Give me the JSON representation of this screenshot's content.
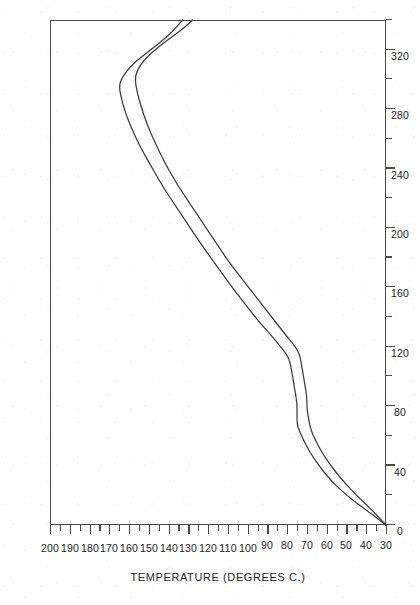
{
  "figure": {
    "style": "scanned-patent-line-drawing",
    "orientation": "rotated-90-ccw",
    "ink_color": "#3c3c3c",
    "paper_color": "#fefefe"
  },
  "chart_data": {
    "type": "line",
    "title": "",
    "xlabel": "CURE TIME (SECONDS)",
    "ylabel": "TEMPERATURE (DEGREES C.)",
    "xlim": [
      0,
      340
    ],
    "ylim": [
      30,
      200
    ],
    "grid": false,
    "legend": "none",
    "x_major_ticks": [
      0,
      40,
      80,
      120,
      160,
      200,
      240,
      280,
      320
    ],
    "x_minor_step": 20,
    "x_tick_labels": [
      "0",
      "40",
      "80",
      "120",
      "160",
      "200",
      "240",
      "280",
      "320"
    ],
    "y_major_ticks": [
      30,
      40,
      50,
      60,
      70,
      80,
      90,
      100,
      110,
      120,
      130,
      140,
      150,
      160,
      170,
      180,
      190,
      200
    ],
    "y_minor_step": 5,
    "y_tick_labels": [
      "30",
      "40",
      "50",
      "60",
      "70",
      "80",
      "90",
      "100",
      "110",
      "120",
      "130",
      "140",
      "150",
      "160",
      "170",
      "180",
      "190",
      "200"
    ],
    "series": [
      {
        "name": "upper-curve",
        "points": [
          [
            0,
            30
          ],
          [
            10,
            40
          ],
          [
            20,
            50
          ],
          [
            30,
            58
          ],
          [
            40,
            64
          ],
          [
            50,
            69
          ],
          [
            58,
            72
          ],
          [
            64,
            74
          ],
          [
            68,
            75
          ],
          [
            74,
            75
          ],
          [
            82,
            75
          ],
          [
            90,
            76
          ],
          [
            98,
            77
          ],
          [
            106,
            78
          ],
          [
            112,
            79
          ],
          [
            118,
            82
          ],
          [
            126,
            87
          ],
          [
            138,
            95
          ],
          [
            150,
            102
          ],
          [
            162,
            109
          ],
          [
            175,
            116
          ],
          [
            188,
            123
          ],
          [
            200,
            129
          ],
          [
            214,
            136
          ],
          [
            228,
            143
          ],
          [
            242,
            149
          ],
          [
            256,
            155
          ],
          [
            268,
            159
          ],
          [
            278,
            162
          ],
          [
            288,
            164
          ],
          [
            295,
            165
          ],
          [
            300,
            164
          ],
          [
            308,
            160
          ],
          [
            316,
            153
          ],
          [
            324,
            145
          ],
          [
            332,
            138
          ],
          [
            340,
            133
          ]
        ]
      },
      {
        "name": "lower-curve",
        "points": [
          [
            0,
            30
          ],
          [
            10,
            37
          ],
          [
            20,
            45
          ],
          [
            30,
            52
          ],
          [
            40,
            58
          ],
          [
            50,
            63
          ],
          [
            58,
            66
          ],
          [
            64,
            68
          ],
          [
            70,
            69
          ],
          [
            78,
            70
          ],
          [
            86,
            70
          ],
          [
            94,
            71
          ],
          [
            102,
            72
          ],
          [
            110,
            73
          ],
          [
            116,
            74
          ],
          [
            122,
            77
          ],
          [
            130,
            82
          ],
          [
            142,
            89
          ],
          [
            154,
            96
          ],
          [
            166,
            103
          ],
          [
            178,
            110
          ],
          [
            190,
            116
          ],
          [
            202,
            122
          ],
          [
            216,
            129
          ],
          [
            230,
            136
          ],
          [
            244,
            142
          ],
          [
            258,
            147
          ],
          [
            270,
            151
          ],
          [
            282,
            154
          ],
          [
            292,
            156
          ],
          [
            300,
            157
          ],
          [
            306,
            156
          ],
          [
            314,
            152
          ],
          [
            322,
            145
          ],
          [
            330,
            137
          ],
          [
            336,
            131
          ],
          [
            340,
            128
          ]
        ]
      }
    ]
  }
}
